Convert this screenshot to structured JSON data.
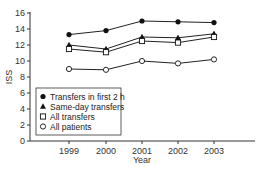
{
  "chart_data": {
    "type": "line",
    "title": "",
    "xlabel": "Year",
    "ylabel": "ISS",
    "x": [
      "1999",
      "2000",
      "2001",
      "2002",
      "2003"
    ],
    "yticks": [
      0,
      2,
      4,
      6,
      8,
      10,
      12,
      14,
      16
    ],
    "ylim": [
      0,
      16
    ],
    "grid": false,
    "legend_position": "lower-left inside",
    "series": [
      {
        "name": "Transfers in first 2 h",
        "marker": "filled-circle",
        "values": [
          13.3,
          13.8,
          15.0,
          14.9,
          14.8
        ]
      },
      {
        "name": "Same-day transfers",
        "marker": "filled-triangle",
        "values": [
          12.0,
          11.5,
          13.0,
          12.9,
          13.4
        ]
      },
      {
        "name": "All transfers",
        "marker": "open-square",
        "values": [
          11.5,
          11.1,
          12.5,
          12.3,
          13.0
        ]
      },
      {
        "name": "All patients",
        "marker": "open-circle",
        "values": [
          9.0,
          8.9,
          10.0,
          9.7,
          10.2
        ]
      }
    ]
  }
}
